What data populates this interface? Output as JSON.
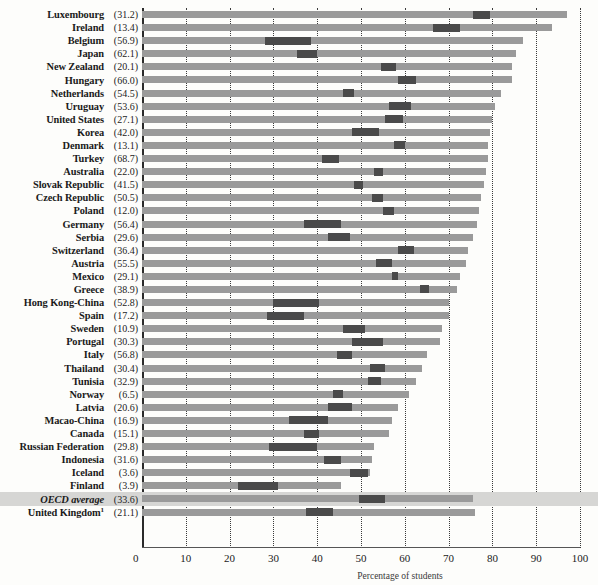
{
  "chart_data": {
    "type": "bar",
    "title": "",
    "xlabel": "Percentage of students",
    "ylabel": "",
    "xlim": [
      0,
      100
    ],
    "grid": true,
    "legend_position": "none",
    "xticks": [
      0,
      10,
      20,
      30,
      40,
      50,
      60,
      70,
      80,
      90,
      100
    ],
    "categories": [
      "Luxembourg",
      "Ireland",
      "Belgium",
      "Japan",
      "New Zealand",
      "Hungary",
      "Netherlands",
      "Uruguay",
      "United States",
      "Korea",
      "Denmark",
      "Turkey",
      "Australia",
      "Slovak Republic",
      "Czech Republic",
      "Poland",
      "Germany",
      "Serbia",
      "Switzerland",
      "Austria",
      "Mexico",
      "Greece",
      "Hong Kong-China",
      "Spain",
      "Sweden",
      "Portugal",
      "Italy",
      "Thailand",
      "Tunisia",
      "Norway",
      "Latvia",
      "Macao-China",
      "Canada",
      "Russian Federation",
      "Indonesia",
      "Iceland",
      "Finland",
      "OECD average",
      "United Kingdom"
    ],
    "value_label_note": "Value in parentheses after each country name",
    "series": [
      {
        "name": "Bar total length (percentage of students)",
        "values": [
          97.0,
          93.5,
          87.0,
          85.5,
          84.5,
          84.5,
          82.0,
          80.5,
          80.0,
          79.5,
          79.0,
          79.0,
          78.5,
          78.0,
          77.5,
          77.0,
          76.5,
          75.5,
          74.5,
          74.0,
          72.5,
          72.0,
          70.0,
          70.0,
          68.5,
          68.0,
          65.0,
          64.0,
          62.5,
          61.0,
          58.5,
          57.0,
          56.5,
          53.0,
          52.5,
          52.0,
          45.5,
          75.5,
          76.0
        ]
      },
      {
        "name": "Dark segment start",
        "values": [
          75.5,
          66.5,
          28.0,
          35.5,
          54.5,
          58.5,
          46.0,
          56.5,
          55.5,
          48.0,
          57.5,
          41.0,
          53.0,
          48.5,
          52.5,
          55.0,
          37.0,
          42.5,
          58.5,
          53.5,
          57.0,
          63.5,
          30.0,
          28.5,
          46.0,
          48.0,
          44.5,
          52.0,
          51.5,
          43.5,
          42.5,
          33.5,
          37.0,
          29.0,
          41.5,
          47.5,
          22.0,
          49.5,
          37.5
        ]
      },
      {
        "name": "Dark segment end",
        "values": [
          79.5,
          72.5,
          38.5,
          40.0,
          58.0,
          62.5,
          48.5,
          61.5,
          59.5,
          54.0,
          60.0,
          45.0,
          55.0,
          50.5,
          55.0,
          57.5,
          45.5,
          47.5,
          62.0,
          57.0,
          58.5,
          65.5,
          40.5,
          37.0,
          51.0,
          55.0,
          48.0,
          55.5,
          54.5,
          46.0,
          48.0,
          42.5,
          40.5,
          40.0,
          45.5,
          51.5,
          31.0,
          55.5,
          43.5
        ]
      }
    ],
    "point_labels": [
      "(31.2)",
      "(13.4)",
      "(56.9)",
      "(62.1)",
      "(20.1)",
      "(66.0)",
      "(54.5)",
      "(53.6)",
      "(27.1)",
      "(42.0)",
      "(13.1)",
      "(68.7)",
      "(22.0)",
      "(41.5)",
      "(50.5)",
      "(12.0)",
      "(56.4)",
      "(29.6)",
      "(36.4)",
      "(55.5)",
      "(29.1)",
      "(38.9)",
      "(52.8)",
      "(17.2)",
      "(10.9)",
      "(30.3)",
      "(56.8)",
      "(30.4)",
      "(32.9)",
      "(6.5)",
      "(20.6)",
      "(16.9)",
      "(15.1)",
      "(29.8)",
      "(31.6)",
      "(3.6)",
      "(3.9)",
      "(33.6)",
      "(21.1)"
    ]
  },
  "colors": {
    "bar": "#9a9a9a",
    "bar_dark": "#4a4a4a",
    "highlight_band": "#d6d6d4",
    "grid": "#3a3a3a",
    "axis": "#2a2a2a",
    "text": "#1a1a1a"
  },
  "rows": [
    {
      "name": "Luxembourg",
      "value": "(31.2)",
      "total": 97.0,
      "d0": 75.5,
      "d1": 79.5,
      "italic": false,
      "highlight": false,
      "superscript": ""
    },
    {
      "name": "Ireland",
      "value": "(13.4)",
      "total": 93.5,
      "d0": 66.5,
      "d1": 72.5,
      "italic": false,
      "highlight": false,
      "superscript": ""
    },
    {
      "name": "Belgium",
      "value": "(56.9)",
      "total": 87.0,
      "d0": 28.0,
      "d1": 38.5,
      "italic": false,
      "highlight": false,
      "superscript": ""
    },
    {
      "name": "Japan",
      "value": "(62.1)",
      "total": 85.5,
      "d0": 35.5,
      "d1": 40.0,
      "italic": false,
      "highlight": false,
      "superscript": ""
    },
    {
      "name": "New Zealand",
      "value": "(20.1)",
      "total": 84.5,
      "d0": 54.5,
      "d1": 58.0,
      "italic": false,
      "highlight": false,
      "superscript": ""
    },
    {
      "name": "Hungary",
      "value": "(66.0)",
      "total": 84.5,
      "d0": 58.5,
      "d1": 62.5,
      "italic": false,
      "highlight": false,
      "superscript": ""
    },
    {
      "name": "Netherlands",
      "value": "(54.5)",
      "total": 82.0,
      "d0": 46.0,
      "d1": 48.5,
      "italic": false,
      "highlight": false,
      "superscript": ""
    },
    {
      "name": "Uruguay",
      "value": "(53.6)",
      "total": 80.5,
      "d0": 56.5,
      "d1": 61.5,
      "italic": false,
      "highlight": false,
      "superscript": ""
    },
    {
      "name": "United States",
      "value": "(27.1)",
      "total": 80.0,
      "d0": 55.5,
      "d1": 59.5,
      "italic": false,
      "highlight": false,
      "superscript": ""
    },
    {
      "name": "Korea",
      "value": "(42.0)",
      "total": 79.5,
      "d0": 48.0,
      "d1": 54.0,
      "italic": false,
      "highlight": false,
      "superscript": ""
    },
    {
      "name": "Denmark",
      "value": "(13.1)",
      "total": 79.0,
      "d0": 57.5,
      "d1": 60.0,
      "italic": false,
      "highlight": false,
      "superscript": ""
    },
    {
      "name": "Turkey",
      "value": "(68.7)",
      "total": 79.0,
      "d0": 41.0,
      "d1": 45.0,
      "italic": false,
      "highlight": false,
      "superscript": ""
    },
    {
      "name": "Australia",
      "value": "(22.0)",
      "total": 78.5,
      "d0": 53.0,
      "d1": 55.0,
      "italic": false,
      "highlight": false,
      "superscript": ""
    },
    {
      "name": "Slovak Republic",
      "value": "(41.5)",
      "total": 78.0,
      "d0": 48.5,
      "d1": 50.5,
      "italic": false,
      "highlight": false,
      "superscript": ""
    },
    {
      "name": "Czech Republic",
      "value": "(50.5)",
      "total": 77.5,
      "d0": 52.5,
      "d1": 55.0,
      "italic": false,
      "highlight": false,
      "superscript": ""
    },
    {
      "name": "Poland",
      "value": "(12.0)",
      "total": 77.0,
      "d0": 55.0,
      "d1": 57.5,
      "italic": false,
      "highlight": false,
      "superscript": ""
    },
    {
      "name": "Germany",
      "value": "(56.4)",
      "total": 76.5,
      "d0": 37.0,
      "d1": 45.5,
      "italic": false,
      "highlight": false,
      "superscript": ""
    },
    {
      "name": "Serbia",
      "value": "(29.6)",
      "total": 75.5,
      "d0": 42.5,
      "d1": 47.5,
      "italic": false,
      "highlight": false,
      "superscript": ""
    },
    {
      "name": "Switzerland",
      "value": "(36.4)",
      "total": 74.5,
      "d0": 58.5,
      "d1": 62.0,
      "italic": false,
      "highlight": false,
      "superscript": ""
    },
    {
      "name": "Austria",
      "value": "(55.5)",
      "total": 74.0,
      "d0": 53.5,
      "d1": 57.0,
      "italic": false,
      "highlight": false,
      "superscript": ""
    },
    {
      "name": "Mexico",
      "value": "(29.1)",
      "total": 72.5,
      "d0": 57.0,
      "d1": 58.5,
      "italic": false,
      "highlight": false,
      "superscript": ""
    },
    {
      "name": "Greece",
      "value": "(38.9)",
      "total": 72.0,
      "d0": 63.5,
      "d1": 65.5,
      "italic": false,
      "highlight": false,
      "superscript": ""
    },
    {
      "name": "Hong Kong-China",
      "value": "(52.8)",
      "total": 70.0,
      "d0": 30.0,
      "d1": 40.5,
      "italic": false,
      "highlight": false,
      "superscript": ""
    },
    {
      "name": "Spain",
      "value": "(17.2)",
      "total": 70.0,
      "d0": 28.5,
      "d1": 37.0,
      "italic": false,
      "highlight": false,
      "superscript": ""
    },
    {
      "name": "Sweden",
      "value": "(10.9)",
      "total": 68.5,
      "d0": 46.0,
      "d1": 51.0,
      "italic": false,
      "highlight": false,
      "superscript": ""
    },
    {
      "name": "Portugal",
      "value": "(30.3)",
      "total": 68.0,
      "d0": 48.0,
      "d1": 55.0,
      "italic": false,
      "highlight": false,
      "superscript": ""
    },
    {
      "name": "Italy",
      "value": "(56.8)",
      "total": 65.0,
      "d0": 44.5,
      "d1": 48.0,
      "italic": false,
      "highlight": false,
      "superscript": ""
    },
    {
      "name": "Thailand",
      "value": "(30.4)",
      "total": 64.0,
      "d0": 52.0,
      "d1": 55.5,
      "italic": false,
      "highlight": false,
      "superscript": ""
    },
    {
      "name": "Tunisia",
      "value": "(32.9)",
      "total": 62.5,
      "d0": 51.5,
      "d1": 54.5,
      "italic": false,
      "highlight": false,
      "superscript": ""
    },
    {
      "name": "Norway",
      "value": "(6.5)",
      "total": 61.0,
      "d0": 43.5,
      "d1": 46.0,
      "italic": false,
      "highlight": false,
      "superscript": ""
    },
    {
      "name": "Latvia",
      "value": "(20.6)",
      "total": 58.5,
      "d0": 42.5,
      "d1": 48.0,
      "italic": false,
      "highlight": false,
      "superscript": ""
    },
    {
      "name": "Macao-China",
      "value": "(16.9)",
      "total": 57.0,
      "d0": 33.5,
      "d1": 42.5,
      "italic": false,
      "highlight": false,
      "superscript": ""
    },
    {
      "name": "Canada",
      "value": "(15.1)",
      "total": 56.5,
      "d0": 37.0,
      "d1": 40.5,
      "italic": false,
      "highlight": false,
      "superscript": ""
    },
    {
      "name": "Russian Federation",
      "value": "(29.8)",
      "total": 53.0,
      "d0": 29.0,
      "d1": 40.0,
      "italic": false,
      "highlight": false,
      "superscript": ""
    },
    {
      "name": "Indonesia",
      "value": "(31.6)",
      "total": 52.5,
      "d0": 41.5,
      "d1": 45.5,
      "italic": false,
      "highlight": false,
      "superscript": ""
    },
    {
      "name": "Iceland",
      "value": "(3.6)",
      "total": 52.0,
      "d0": 47.5,
      "d1": 51.5,
      "italic": false,
      "highlight": false,
      "superscript": ""
    },
    {
      "name": "Finland",
      "value": "(3.9)",
      "total": 45.5,
      "d0": 22.0,
      "d1": 31.0,
      "italic": false,
      "highlight": false,
      "superscript": ""
    },
    {
      "name": "OECD average",
      "value": "(33.6)",
      "total": 75.5,
      "d0": 49.5,
      "d1": 55.5,
      "italic": true,
      "highlight": true,
      "superscript": ""
    },
    {
      "name": "United Kingdom",
      "value": "(21.1)",
      "total": 76.0,
      "d0": 37.5,
      "d1": 43.5,
      "italic": false,
      "highlight": false,
      "superscript": "1"
    }
  ],
  "axis": {
    "zero_label": "0",
    "ticks": [
      "10",
      "20",
      "30",
      "40",
      "50",
      "60",
      "70",
      "80",
      "90",
      "100"
    ],
    "title": "Percentage of students"
  }
}
